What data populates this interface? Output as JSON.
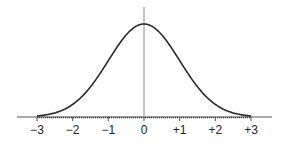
{
  "chart_data": {
    "type": "line",
    "title": "",
    "subtitle": "",
    "xlabel": "",
    "ylabel": "",
    "x_tick_labels": [
      "−3",
      "−2",
      "−1",
      "0",
      "+1",
      "+2",
      "+3"
    ],
    "x_ticks": [
      -3,
      -2,
      -1,
      0,
      1,
      2,
      3
    ],
    "xlim": [
      -3.5,
      3.5
    ],
    "ylim": [
      0,
      0.45
    ],
    "grid": false,
    "legend": null,
    "series": [
      {
        "name": "normal density",
        "mean": 0,
        "sd": 1,
        "x": [
          -3,
          -2.5,
          -2,
          -1.5,
          -1,
          -0.5,
          0,
          0.5,
          1,
          1.5,
          2,
          2.5,
          3
        ],
        "values": [
          0.004,
          0.018,
          0.054,
          0.13,
          0.242,
          0.352,
          0.399,
          0.352,
          0.242,
          0.13,
          0.054,
          0.018,
          0.004
        ]
      }
    ],
    "vertical_reference_line_at": 0,
    "baseline_style": "dotted between -3 and +3"
  },
  "colors": {
    "curve": "#2a2a2a",
    "axis": "#555555",
    "center_line": "#8a8a8a",
    "text": "#222222"
  }
}
